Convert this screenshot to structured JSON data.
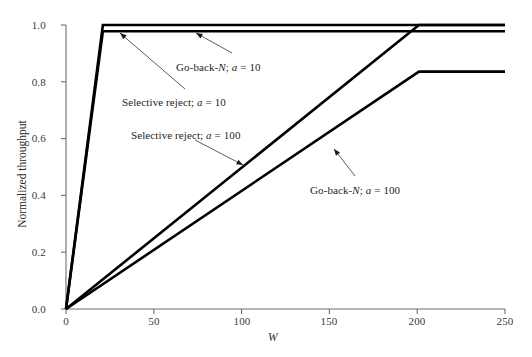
{
  "figure": {
    "background_color": "#ffffff",
    "line_color": "#000000",
    "axis_color": "#6f6f6f",
    "width": 532,
    "height": 357
  },
  "axes": {
    "xlabel": "W",
    "ylabel": "Normalized throughput",
    "xticks": [
      "0",
      "50",
      "100",
      "150",
      "200",
      "250"
    ],
    "xtick_values": [
      0,
      50,
      100,
      150,
      200,
      250
    ],
    "yticks": [
      "0.0",
      "0.2",
      "0.4",
      "0.6",
      "0.8",
      "1.0"
    ],
    "ytick_values": [
      0.0,
      0.2,
      0.4,
      0.6,
      0.8,
      1.0
    ],
    "xlim": [
      0,
      250
    ],
    "ylim": [
      0.0,
      1.0
    ],
    "grid": false
  },
  "annotations": [
    {
      "name": "go-back-n-a10",
      "prefix": "Go-back-",
      "italic1": "N",
      "middle": "; ",
      "italic2": "a",
      "suffix": " = 10"
    },
    {
      "name": "selective-reject-a10",
      "prefix": "Selective reject; ",
      "italic1": "a",
      "middle": "",
      "italic2": "",
      "suffix": " = 10"
    },
    {
      "name": "selective-reject-a100",
      "prefix": "Selective reject; ",
      "italic1": "a",
      "middle": "",
      "italic2": "",
      "suffix": " = 100"
    },
    {
      "name": "go-back-n-a100",
      "prefix": "Go-back-",
      "italic1": "N",
      "middle": "; ",
      "italic2": "a",
      "suffix": " = 100"
    }
  ],
  "chart_data": {
    "type": "line",
    "title": "",
    "xlabel": "W",
    "ylabel": "Normalized throughput",
    "xlim": [
      0,
      250
    ],
    "ylim": [
      0.0,
      1.0
    ],
    "grid": false,
    "legend_position": "inline-annotations",
    "series": [
      {
        "name": "Selective reject; a = 10",
        "label": "Selective reject; a = 10",
        "a": 10,
        "points": [
          [
            0,
            0.0
          ],
          [
            21,
            1.0
          ],
          [
            250,
            1.0
          ]
        ],
        "knee_W": 21,
        "plateau": 1.0
      },
      {
        "name": "Go-back-N; a = 10",
        "label": "Go-back-N; a = 10",
        "a": 10,
        "points": [
          [
            0,
            0.0
          ],
          [
            21,
            0.978
          ],
          [
            250,
            0.978
          ]
        ],
        "knee_W": 21,
        "plateau": 0.978
      },
      {
        "name": "Selective reject; a = 100",
        "label": "Selective reject; a = 100",
        "a": 100,
        "points": [
          [
            0,
            0.0
          ],
          [
            201,
            1.0
          ],
          [
            250,
            1.0
          ]
        ],
        "knee_W": 201,
        "plateau": 1.0
      },
      {
        "name": "Go-back-N; a = 100",
        "label": "Go-back-N; a = 100",
        "a": 100,
        "points": [
          [
            0,
            0.0
          ],
          [
            201,
            0.836
          ],
          [
            250,
            0.836
          ]
        ],
        "knee_W": 201,
        "plateau": 0.836
      }
    ]
  }
}
